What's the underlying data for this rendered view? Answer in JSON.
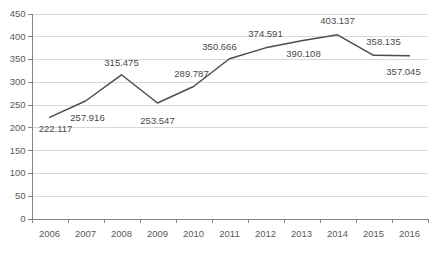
{
  "chart_data": {
    "type": "line",
    "title": "",
    "subtitle": "",
    "xlabel": "",
    "ylabel": "",
    "categories": [
      "2006",
      "2007",
      "2008",
      "2009",
      "2010",
      "2011",
      "2012",
      "2013",
      "2014",
      "2015",
      "2016"
    ],
    "values": [
      222.117,
      257.916,
      315.475,
      253.547,
      289.787,
      350.666,
      374.591,
      390.108,
      403.137,
      358.135,
      357.045
    ],
    "data_labels": [
      "222.117",
      "257.916",
      "315.475",
      "253.547",
      "289.787",
      "350.666",
      "374.591",
      "390.108",
      "403.137",
      "358.135",
      "357.045"
    ],
    "series": [
      {
        "name": "",
        "values": [
          222.117,
          257.916,
          315.475,
          253.547,
          289.787,
          350.666,
          374.591,
          390.108,
          403.137,
          358.135,
          357.045
        ],
        "color": "#4d4d4d"
      }
    ],
    "ylim": [
      0,
      450
    ],
    "ytick_values": [
      0,
      50,
      100,
      150,
      200,
      250,
      300,
      350,
      400,
      450
    ],
    "ytick_labels": [
      "0",
      "50",
      "100",
      "150",
      "200",
      "250",
      "300",
      "350",
      "400",
      "450"
    ],
    "xtick_labels": [
      "2006",
      "2007",
      "2008",
      "2009",
      "2010",
      "2011",
      "2012",
      "2013",
      "2014",
      "2015",
      "2016"
    ],
    "grid": true,
    "grid_axis": "y",
    "legend": false,
    "legend_position": "none",
    "gridline_color": "#d9d9d9",
    "axis_color": "#868686",
    "text_color": "#595959",
    "background_color": "#ffffff"
  },
  "label_offsets": [
    {
      "dx": 6,
      "dy": 15
    },
    {
      "dx": 2,
      "dy": 20
    },
    {
      "dx": 0,
      "dy": -9
    },
    {
      "dx": 0,
      "dy": 21
    },
    {
      "dx": -2,
      "dy": -9
    },
    {
      "dx": -10,
      "dy": -9
    },
    {
      "dx": 0,
      "dy": -11
    },
    {
      "dx": 2,
      "dy": 16
    },
    {
      "dx": 0,
      "dy": -11
    },
    {
      "dx": 10,
      "dy": -10
    },
    {
      "dx": -6,
      "dy": 19
    }
  ]
}
